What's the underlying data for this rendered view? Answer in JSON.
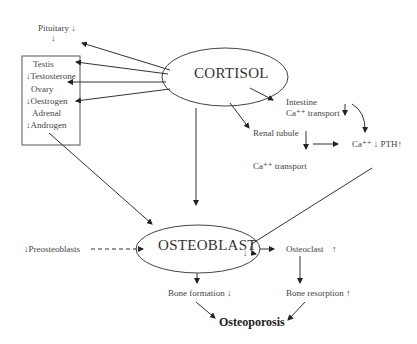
{
  "nodes": {
    "pituitary": {
      "label": "Pituitary ↓",
      "sub": "↓"
    },
    "box": {
      "testis": "Testis",
      "testosterone": "↓Testosterone",
      "ovary": "Ovary",
      "oestrogen": "↓Oestrogen",
      "adrenal": "Adrenal",
      "androgen": "↓Androgen"
    },
    "cortisol": "CORTISOL",
    "intestine": "Intestine",
    "intestine_ca": "Ca⁺⁺ transport",
    "intestine_arrow": "↓",
    "renal": "Renal tubule",
    "renal_ca": "Ca⁺⁺ transport",
    "ca_pth": "Ca⁺⁺ ↓ PTH↑",
    "preosteoblasts": "↓Preosteoblasts",
    "osteoblast": "OSTEOBLAST",
    "osteoblast_arrow": "↓",
    "osteoclast": "Osteoclast",
    "osteoclast_arrow": "↑",
    "bone_formation": "Bone formation ↓",
    "bone_resorption": "Bone resorption ↑",
    "osteoporosis": "Osteoporosis"
  },
  "colors": {
    "line": "#333333",
    "text": "#444444"
  }
}
